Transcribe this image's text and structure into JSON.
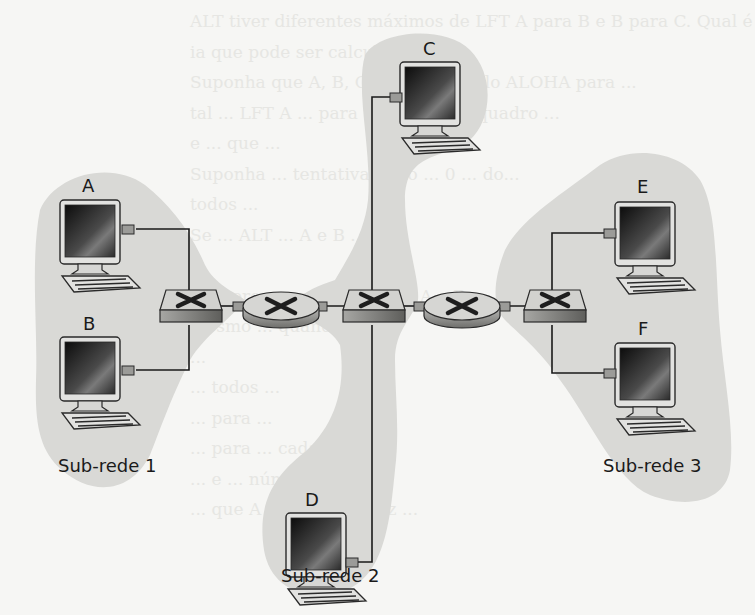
{
  "figure": {
    "type": "network-topology",
    "colors": {
      "background": "#f6f6f4",
      "subnet_fill": "#d9d9d6",
      "link": "#1a1a1a",
      "device_face": "#d4d4d2",
      "device_side": "#8f8f8c",
      "device_x": "#1e1e1e",
      "screen_dark": "#1b1b1b"
    }
  },
  "subnets": [
    {
      "id": "subnet-1",
      "label": "Sub-rede 1",
      "hosts": [
        "A",
        "B"
      ]
    },
    {
      "id": "subnet-2",
      "label": "Sub-rede 2",
      "hosts": [
        "C",
        "D"
      ]
    },
    {
      "id": "subnet-3",
      "label": "Sub-rede 3",
      "hosts": [
        "E",
        "F"
      ]
    }
  ],
  "hosts": {
    "A": {
      "label": "A"
    },
    "B": {
      "label": "B"
    },
    "C": {
      "label": "C"
    },
    "D": {
      "label": "D"
    },
    "E": {
      "label": "E"
    },
    "F": {
      "label": "F"
    }
  },
  "devices": {
    "switches": [
      "switch-1",
      "switch-2",
      "switch-3"
    ],
    "routers": [
      "router-1",
      "router-2"
    ]
  },
  "links": [
    [
      "A",
      "switch-1"
    ],
    [
      "B",
      "switch-1"
    ],
    [
      "switch-1",
      "router-1"
    ],
    [
      "router-1",
      "switch-2"
    ],
    [
      "C",
      "switch-2"
    ],
    [
      "D",
      "switch-2"
    ],
    [
      "switch-2",
      "router-2"
    ],
    [
      "router-2",
      "switch-3"
    ],
    [
      "E",
      "switch-3"
    ],
    [
      "F",
      "switch-3"
    ]
  ],
  "background_text_lines": [
    "ALT tiver diferentes máximos de LFT A para B e B para C. Qual é o maior",
    "ia que pode ser calculada ...",
    "Suponha que A, B, C, D ... protocolo ALOHA para ...",
    "tal ... LFT A ... para transmitir ... quadro ...",
    "e ... que ... ",
    "Suponha ... tentativa ... nó ... 0 ... do...",
    "todos ...",
    "Se ... ALT ... A e B ...",
    "...",
    "Número ... entre os nós ... A e B ...",
    "mesmo ... quando ...",
    "...",
    "... todos ...",
    "... para ...",
    "... para ... cada ...",
    "... e ... número ...",
    "... que A ... primeira vez ..."
  ]
}
